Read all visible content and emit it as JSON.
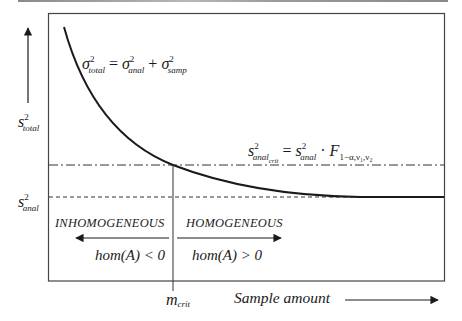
{
  "diagram": {
    "y_axis_label": {
      "base": "s",
      "sup": "2",
      "sub": "total"
    },
    "anal_label": {
      "base": "s",
      "sup": "2",
      "sub": "anal"
    },
    "x_axis_label": "Sample amount",
    "m_crit_label": {
      "base": "m",
      "sub": "crit"
    },
    "top_formula": {
      "lhs": {
        "base": "σ",
        "sup": "2",
        "sub": "total"
      },
      "eq": "=",
      "t1": {
        "base": "σ",
        "sup": "2",
        "sub": "anal"
      },
      "plus": "+",
      "t2": {
        "base": "σ",
        "sup": "2",
        "sub": "samp"
      }
    },
    "crit_formula": {
      "lhs": {
        "base": "s",
        "sup": "2",
        "sub": "anal",
        "subsub": "crit"
      },
      "eq": "=",
      "t1": {
        "base": "s",
        "sup": "2",
        "sub": "anal"
      },
      "dot": "·",
      "F": {
        "base": "F",
        "sub": "1−α,ν₁,ν₂"
      }
    },
    "regions": {
      "left": {
        "title": "INHOMOGENEOUS",
        "condition": "hom(A) < 0"
      },
      "right": {
        "title": "HOMOGENEOUS",
        "condition": "hom(A) > 0"
      }
    },
    "colors": {
      "line": "#1a1a1a",
      "box": "#444444",
      "topbar": "#999999"
    }
  }
}
